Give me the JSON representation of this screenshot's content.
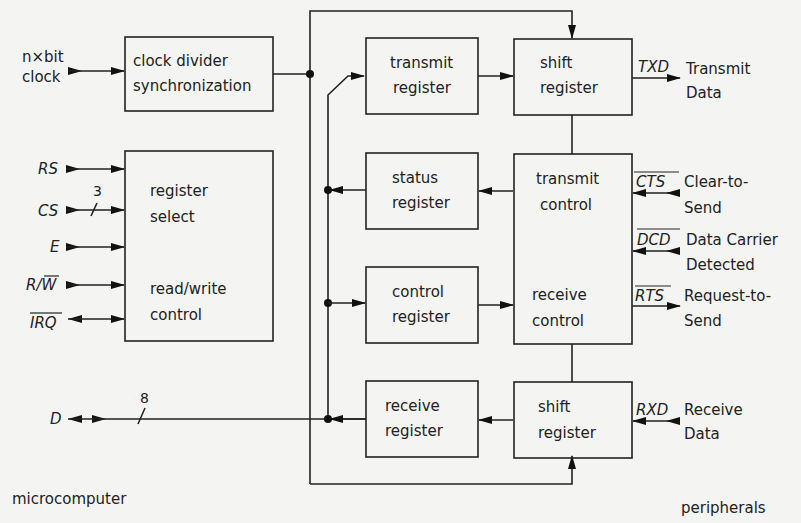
{
  "diagram": {
    "blocks": {
      "clock_divider": [
        "clock divider",
        "synchronization"
      ],
      "register_select": [
        "register",
        "select"
      ],
      "read_write_control": [
        "read/write",
        "control"
      ],
      "transmit_register": [
        "transmit",
        "register"
      ],
      "status_register": [
        "status",
        "register"
      ],
      "control_register": [
        "control",
        "register"
      ],
      "receive_register": [
        "receive",
        "register"
      ],
      "shift_register_tx": [
        "shift",
        "register"
      ],
      "shift_register_rx": [
        "shift",
        "register"
      ],
      "transmit_control": [
        "transmit",
        "control"
      ],
      "receive_control": [
        "receive",
        "control"
      ]
    },
    "inputs_left": {
      "clock": [
        "n×bit",
        "clock"
      ],
      "rs": "RS",
      "cs": "CS",
      "cs_bus_width": "3",
      "e": "E",
      "rw": "R/W̅",
      "rw_r": "R/",
      "rw_w": "W",
      "irq": "IRQ",
      "d": "D",
      "d_bus_width": "8"
    },
    "signals_right": {
      "txd": {
        "name": "TXD",
        "desc": [
          "Transmit",
          "Data"
        ]
      },
      "cts": {
        "name": "CTS",
        "desc": [
          "Clear-to-",
          "Send"
        ]
      },
      "dcd": {
        "name": "DCD",
        "desc": [
          "Data Carrier",
          "Detected"
        ]
      },
      "rts": {
        "name": "RTS",
        "desc": [
          "Request-to-",
          "Send"
        ]
      },
      "rxd": {
        "name": "RXD",
        "desc": [
          "Receive",
          "Data"
        ]
      }
    },
    "side_labels": {
      "left": "microcomputer",
      "right": "peripherals"
    }
  }
}
